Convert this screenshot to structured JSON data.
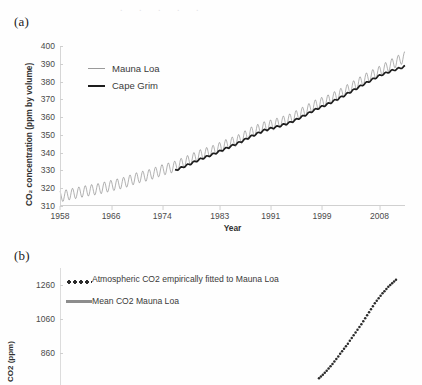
{
  "figure": {
    "panels": [
      {
        "label": "(a)",
        "legend": [
          {
            "name": "Mauna Loa",
            "style": "thin-gray-line"
          },
          {
            "name": "Cape Grim",
            "style": "thick-black-line"
          }
        ]
      },
      {
        "label": "(b)",
        "legend": [
          {
            "name": "Atmospheric CO2 empirically fitted to Mauna Loa",
            "style": "dotted-black"
          },
          {
            "name": "Mean CO2 Mauna Loa",
            "style": "solid-gray"
          }
        ]
      }
    ]
  },
  "chart_data": [
    {
      "type": "line",
      "panel": "(a)",
      "title": "",
      "xlabel": "Year",
      "ylabel": "CO2 concentration (ppm by volume)",
      "ylabel_display": "CO₂ concentration (ppm by volume)",
      "xlim": [
        1958,
        2012
      ],
      "ylim": [
        310,
        400
      ],
      "yticks": [
        400,
        390,
        380,
        370,
        360,
        350,
        340,
        330,
        320,
        310
      ],
      "xticks": [
        1958,
        1966,
        1974,
        1983,
        1991,
        1999,
        2008
      ],
      "grid": false,
      "legend_position": "upper-left-inside",
      "notes": "Monthly data with seasonal sawtooth oscillation; Mauna Loa amplitude approx 6 ppm, Cape Grim nearly smooth and about 3 ppm lower.",
      "series": [
        {
          "name": "Mauna Loa",
          "color": "#8f8f8f",
          "linewidth": 0.7,
          "seasonal_amplitude": 3.1,
          "x": [
            1958,
            1960,
            1962,
            1964,
            1966,
            1968,
            1970,
            1972,
            1974,
            1976,
            1978,
            1980,
            1982,
            1984,
            1986,
            1988,
            1990,
            1992,
            1994,
            1996,
            1998,
            2000,
            2002,
            2004,
            2006,
            2008,
            2010,
            2012
          ],
          "values": [
            315.3,
            316.9,
            318.4,
            319.6,
            321.4,
            323.1,
            325.7,
            327.5,
            330.2,
            332.2,
            335.4,
            338.7,
            341.1,
            344.4,
            347.2,
            351.5,
            354.4,
            356.4,
            358.8,
            362.6,
            366.7,
            369.5,
            373.2,
            377.5,
            381.9,
            385.6,
            389.9,
            393.8
          ]
        },
        {
          "name": "Cape Grim",
          "color": "#1d1d1d",
          "linewidth": 1.7,
          "seasonal_amplitude": 0.5,
          "x": [
            1976,
            1978,
            1980,
            1982,
            1984,
            1986,
            1988,
            1990,
            1992,
            1994,
            1996,
            1998,
            2000,
            2002,
            2004,
            2006,
            2008,
            2010,
            2012
          ],
          "values": [
            330.0,
            333.1,
            336.4,
            339.2,
            342.4,
            345.6,
            349.3,
            352.6,
            354.6,
            356.9,
            360.4,
            364.3,
            367.5,
            371.2,
            375.3,
            379.4,
            383.3,
            386.2,
            388.5
          ]
        }
      ]
    },
    {
      "type": "scatter",
      "panel": "(b)",
      "title": "",
      "xlabel": "",
      "ylabel": "CO2 (ppm)",
      "ylim": [
        660,
        1360
      ],
      "yticks": [
        1260,
        1060,
        860
      ],
      "grid": false,
      "legend_position": "upper-left-inside",
      "cropped": "bottom of panel is cut off by the screenshot edge",
      "series": [
        {
          "name": "Atmospheric CO2 empirically fitted to Mauna Loa",
          "color": "#2b2b2b",
          "marker": "dot",
          "x": [
            0.74,
            0.76,
            0.78,
            0.8,
            0.82,
            0.84,
            0.86,
            0.88,
            0.9,
            0.92,
            0.94,
            0.96
          ],
          "values": [
            700,
            740,
            790,
            845,
            900,
            960,
            1020,
            1085,
            1150,
            1205,
            1252,
            1290
          ]
        },
        {
          "name": "Mean CO2 Mauna Loa",
          "color": "#8d8d8d",
          "marker": "line",
          "x": [],
          "values": []
        }
      ]
    }
  ]
}
